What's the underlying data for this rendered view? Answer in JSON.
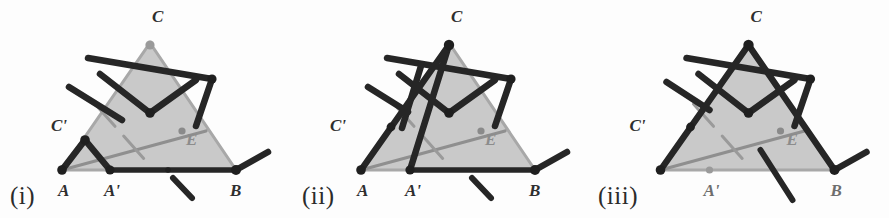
{
  "figure": {
    "kind": "geometric-linkage-diagram",
    "panel_count": 3,
    "background_color": "#fdfdfd",
    "colors": {
      "triangle_fill": "#c9c9c9",
      "triangle_edge": "#a5a5a5",
      "linkage_dark": "#262626",
      "gray_line": "#8f8f8f",
      "label_dark": "#2e2e2e",
      "label_gray": "#8c8c8c"
    }
  },
  "panels": [
    {
      "caption": "(i)",
      "caption_x": 10,
      "caption_y": 182,
      "labels": [
        {
          "text": "C",
          "x": 152,
          "y": 22,
          "tone": "dark"
        },
        {
          "text": "C'",
          "x": 51,
          "y": 131,
          "tone": "dark"
        },
        {
          "text": "E",
          "x": 186,
          "y": 145,
          "tone": "gray"
        },
        {
          "text": "A",
          "x": 58,
          "y": 196,
          "tone": "dark"
        },
        {
          "text": "A'",
          "x": 104,
          "y": 196,
          "tone": "dark"
        },
        {
          "text": "B",
          "x": 230,
          "y": 196,
          "tone": "dark"
        }
      ],
      "triangle": {
        "A": [
          62,
          170
        ],
        "B": [
          236,
          170
        ],
        "C": [
          150,
          43
        ]
      },
      "cevians": [
        {
          "from": [
            62,
            170
          ],
          "to": [
            182,
            138
          ],
          "style": "solid"
        },
        {
          "from": [
            182,
            138
          ],
          "to": [
            206,
            130
          ],
          "style": "solid-light"
        },
        {
          "from": [
            95,
            105
          ],
          "to": [
            143,
            160
          ],
          "style": "dashed"
        }
      ],
      "median_dot": [
        182,
        138
      ],
      "apex_dot": [
        150,
        43
      ],
      "apex_dot_tone": "gray",
      "linkage_nodes": {
        "A": [
          62,
          170
        ],
        "Aprime": [
          110,
          170
        ],
        "Cprime": [
          85,
          140
        ],
        "B": [
          236,
          170
        ]
      },
      "baseline": {
        "from": [
          110,
          170
        ],
        "to": [
          236,
          170
        ]
      }
    },
    {
      "caption": "(ii)",
      "caption_x": 302,
      "caption_y": 182,
      "labels": [
        {
          "text": "C",
          "x": 451,
          "y": 22,
          "tone": "dark"
        },
        {
          "text": "C'",
          "x": 330,
          "y": 131,
          "tone": "dark"
        },
        {
          "text": "E",
          "x": 485,
          "y": 145,
          "tone": "gray"
        },
        {
          "text": "A",
          "x": 357,
          "y": 196,
          "tone": "dark"
        },
        {
          "text": "A'",
          "x": 405,
          "y": 196,
          "tone": "dark"
        },
        {
          "text": "B",
          "x": 529,
          "y": 196,
          "tone": "dark"
        }
      ],
      "triangle": {
        "A": [
          361,
          170
        ],
        "B": [
          535,
          170
        ],
        "C": [
          449,
          43
        ]
      },
      "cevians": [
        {
          "from": [
            361,
            170
          ],
          "to": [
            481,
            138
          ],
          "style": "solid"
        },
        {
          "from": [
            481,
            138
          ],
          "to": [
            505,
            130
          ],
          "style": "solid-light"
        },
        {
          "from": [
            394,
            105
          ],
          "to": [
            442,
            160
          ],
          "style": "dashed"
        }
      ],
      "median_dot": [
        481,
        138
      ],
      "apex_dot": [
        449,
        43
      ],
      "apex_dot_tone": "dark",
      "linkage_nodes": {
        "A": [
          361,
          170
        ],
        "Aprime": [
          410,
          170
        ],
        "Cprime": [
          391,
          127
        ],
        "B": [
          535,
          170
        ]
      },
      "baseline": {
        "from": [
          410,
          170
        ],
        "to": [
          535,
          170
        ]
      }
    },
    {
      "caption": "(iii)",
      "caption_x": 598,
      "caption_y": 182,
      "labels": [
        {
          "text": "C",
          "x": 750,
          "y": 22,
          "tone": "dark"
        },
        {
          "text": "C'",
          "x": 629,
          "y": 131,
          "tone": "dark"
        },
        {
          "text": "E",
          "x": 786,
          "y": 145,
          "tone": "gray"
        },
        {
          "text": "A'",
          "x": 703,
          "y": 196,
          "tone": "midgray"
        },
        {
          "text": "B",
          "x": 830,
          "y": 196,
          "tone": "midgray"
        }
      ],
      "triangle": {
        "A": [
          660,
          170
        ],
        "B": [
          834,
          170
        ],
        "C": [
          748,
          43
        ]
      },
      "cevians": [
        {
          "from": [
            660,
            170
          ],
          "to": [
            780,
            138
          ],
          "style": "solid"
        },
        {
          "from": [
            780,
            138
          ],
          "to": [
            804,
            130
          ],
          "style": "solid-light"
        },
        {
          "from": [
            693,
            105
          ],
          "to": [
            741,
            160
          ],
          "style": "dashed"
        }
      ],
      "median_dot": [
        780,
        138
      ],
      "apex_dot": [
        748,
        43
      ],
      "apex_dot_tone": "dark",
      "linkage_nodes": {
        "A": [
          660,
          170
        ],
        "Aprime": [
          709,
          170
        ],
        "Cprime": [
          690,
          127
        ],
        "B": [
          834,
          170
        ]
      },
      "baseline": null
    }
  ]
}
